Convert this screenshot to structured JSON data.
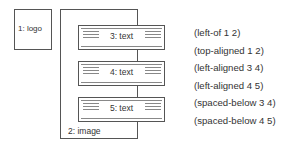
{
  "diagram": {
    "logo": {
      "label": "1: logo"
    },
    "image": {
      "label": "2: image"
    },
    "text_boxes": [
      {
        "label": "3: text"
      },
      {
        "label": "4: text"
      },
      {
        "label": "5: text"
      }
    ],
    "constraints": [
      "(left-of 1 2)",
      "(top-aligned 1 2)",
      "(left-aligned 3 4)",
      "(left-aligned 4 5)",
      "(spaced-below 3 4)",
      "(spaced-below 4 5)"
    ]
  }
}
